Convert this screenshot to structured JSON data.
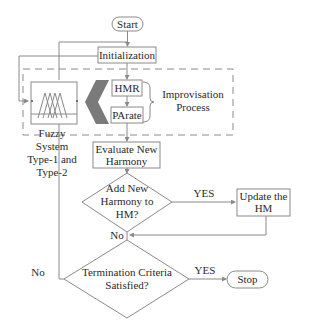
{
  "diagram": {
    "nodes": {
      "start": "Start",
      "initialization": "Initialization",
      "hmr": "HMR",
      "parate": "PArate",
      "improvisation_line1": "Improvisation",
      "improvisation_line2": "Process",
      "fuzzy_line1": "Fuzzy",
      "fuzzy_line2": "System",
      "fuzzy_line3": "Type-1 and",
      "fuzzy_line4": "Type-2",
      "evaluate_line1": "Evaluate New",
      "evaluate_line2": "Harmony",
      "add_line1": "Add New",
      "add_line2": "Harmony to",
      "add_line3": "HM?",
      "update_line1": "Update the",
      "update_line2": "HM",
      "termination_line1": "Termination Criteria",
      "termination_line2": "Satisfied?",
      "stop": "Stop"
    },
    "edge_labels": {
      "add_yes": "YES",
      "add_no": "No",
      "term_yes": "YES",
      "term_no": "No"
    },
    "colors": {
      "line": "#8a8a8a",
      "text": "#2a2a2a",
      "chevron": "#7a7a7a"
    }
  }
}
